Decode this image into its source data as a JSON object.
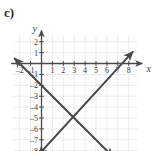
{
  "panel": {
    "label": "c)"
  },
  "colors": {
    "grid_minor": "#e2e2e8",
    "grid_major": "#d2d2da",
    "axis": "#4a4a4a",
    "line": "#4a4a4a",
    "text": "#2b2b2b",
    "background": "#ffffff"
  },
  "chart_data": {
    "type": "line",
    "title": "",
    "subtitle": "",
    "xlabel": "x",
    "ylabel": "y",
    "xlim": [
      -2.6,
      8.8
    ],
    "ylim": [
      -8.8,
      2.6
    ],
    "grid": true,
    "grid_step": 1,
    "legend": "none",
    "x_ticks": [
      -2,
      -1,
      1,
      2,
      3,
      4,
      5,
      6,
      7,
      8
    ],
    "x_tick_labels": [
      "-2",
      "-1",
      "1",
      "2",
      "3",
      "4",
      "5",
      "6",
      "7",
      "8"
    ],
    "y_ticks": [
      2,
      1,
      -1,
      -2,
      -3,
      -4,
      -5,
      -6,
      -7,
      -8
    ],
    "y_tick_labels": [
      "2",
      "1",
      "-1",
      "-2",
      "-3",
      "-4",
      "-5",
      "-6",
      "-7",
      "-8"
    ],
    "series": [
      {
        "name": "descending-line",
        "slope": -1,
        "intercept": -2,
        "arrows": "both",
        "points": [
          {
            "x": -2.5,
            "y": 0.5
          },
          {
            "x": 0,
            "y": -2
          },
          {
            "x": 3.5,
            "y": -5.5
          },
          {
            "x": 6.6,
            "y": -8.6
          }
        ]
      },
      {
        "name": "ascending-line",
        "slope": 1.125,
        "intercept": -8,
        "arrows": "both",
        "points": [
          {
            "x": -0.3,
            "y": -8.4
          },
          {
            "x": 0,
            "y": -8
          },
          {
            "x": 3.5,
            "y": -5.5
          },
          {
            "x": 8.4,
            "y": 1.1
          }
        ]
      }
    ],
    "intersection": {
      "x": 3.5,
      "y": -5.5
    }
  }
}
